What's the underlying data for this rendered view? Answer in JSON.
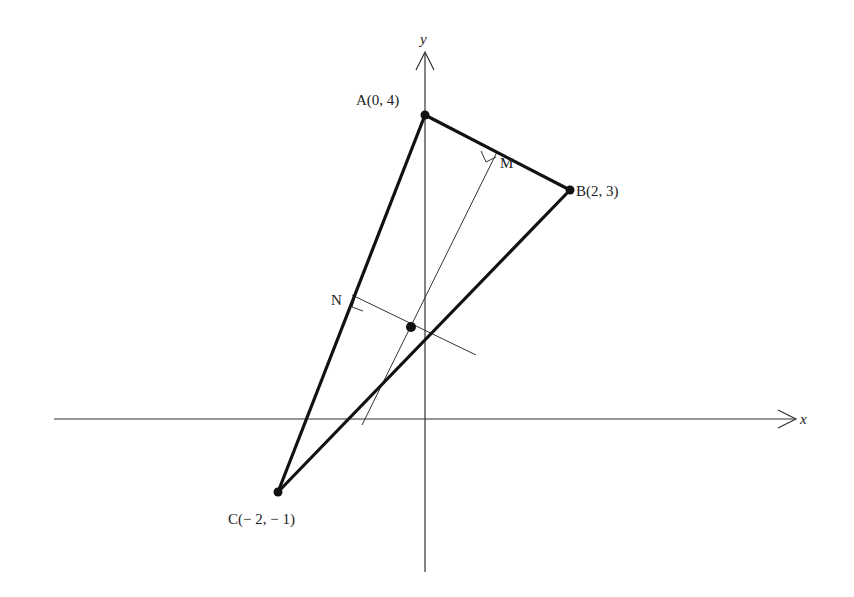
{
  "diagram": {
    "axes": {
      "x_label": "x",
      "y_label": "y"
    },
    "points": [
      {
        "id": "A",
        "label": "A(0, 4)",
        "x": 0,
        "y": 4
      },
      {
        "id": "B",
        "label": "B(2, 3)",
        "x": 2,
        "y": 3
      },
      {
        "id": "C",
        "label": "C(− 2, − 1)",
        "x": -2,
        "y": -1
      }
    ],
    "midpoints": [
      {
        "id": "M",
        "label": "M",
        "of": "AB"
      },
      {
        "id": "N",
        "label": "N",
        "of": "AC"
      }
    ],
    "circumcenter": {
      "label": "",
      "x": -0.1667,
      "y": 1.3333
    },
    "colors": {
      "stroke": "#111111",
      "text": "#222222"
    }
  }
}
